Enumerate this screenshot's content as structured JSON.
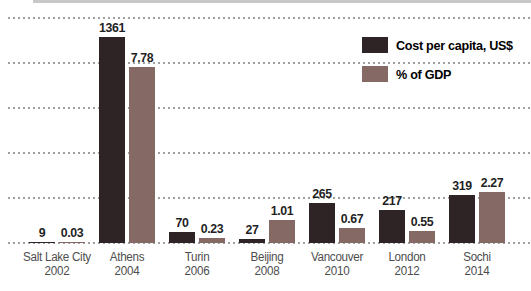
{
  "chart_data": {
    "type": "bar",
    "title": "",
    "categories": [
      {
        "city": "Salt Lake City",
        "year": "2002"
      },
      {
        "city": "Athens",
        "year": "2004"
      },
      {
        "city": "Turin",
        "year": "2006"
      },
      {
        "city": "Beijing",
        "year": "2008"
      },
      {
        "city": "Vancouver",
        "year": "2010"
      },
      {
        "city": "London",
        "year": "2012"
      },
      {
        "city": "Sochi",
        "year": "2014"
      }
    ],
    "series": [
      {
        "name": "Cost per capita, US$",
        "color": "#2e2325",
        "values": [
          9,
          1361,
          70,
          27,
          265,
          217,
          319
        ],
        "value_labels": [
          "9",
          "1361",
          "70",
          "27",
          "265",
          "217",
          "319"
        ]
      },
      {
        "name": "% of GDP",
        "color": "#846964",
        "values": [
          0.03,
          7.78,
          0.23,
          1.01,
          0.67,
          0.55,
          2.27
        ],
        "value_labels": [
          "0.03",
          "7.78",
          "0.23",
          "1.01",
          "0.67",
          "0.55",
          "2.27"
        ]
      }
    ],
    "grid": "dotted-horizontal",
    "gridline_count": 6,
    "y_ticks_labeled": false,
    "value_labels_shown": true,
    "legend_position": "top-right"
  },
  "legend": {
    "items": [
      {
        "label": "Cost per capita, US$",
        "color": "#2e2325"
      },
      {
        "label": "% of GDP",
        "color": "#846964"
      }
    ]
  },
  "colors": {
    "background": "#ffffff",
    "top_strip": "#c7c7c7",
    "grid_dot": "#a0a0a0",
    "value_label": "#1f1f1f",
    "category_label": "#4d4d4d"
  }
}
